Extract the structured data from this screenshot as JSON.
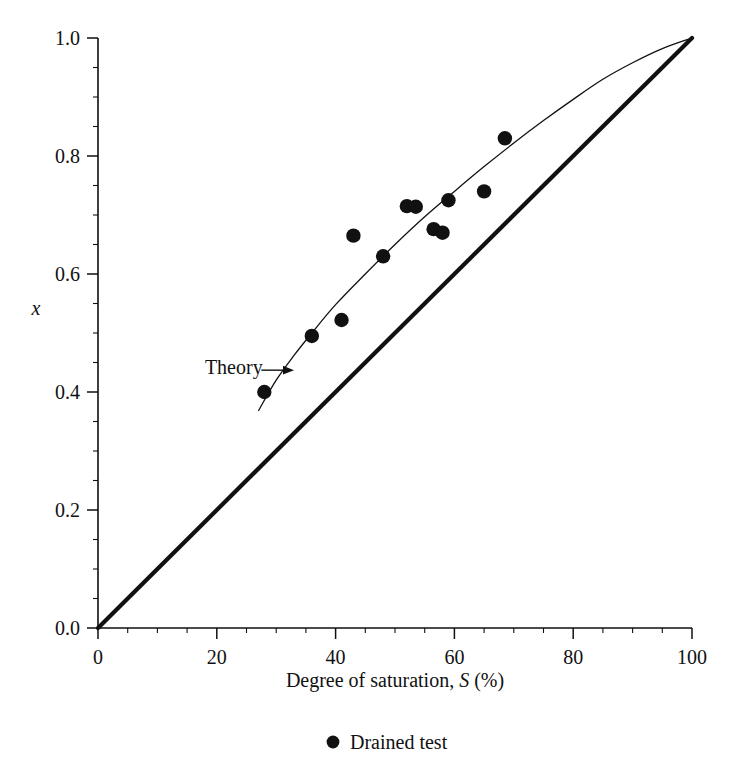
{
  "chart_data": {
    "type": "scatter",
    "title": "",
    "xlabel_text": "Degree of saturation, ",
    "xlabel_symbol": "S",
    "xlabel_units": " (%)",
    "ylabel": "x",
    "xlim": [
      0,
      100
    ],
    "ylim": [
      0.0,
      1.0
    ],
    "grid": false,
    "x_ticks": [
      0,
      20,
      40,
      60,
      80,
      100
    ],
    "x_tick_labels": [
      "0",
      "20",
      "40",
      "60",
      "80",
      "100"
    ],
    "x_minor_step": 5,
    "y_ticks": [
      0.0,
      0.2,
      0.4,
      0.6,
      0.8,
      1.0
    ],
    "y_tick_labels": [
      "0.0",
      "0.2",
      "0.4",
      "0.6",
      "0.8",
      "1.0"
    ],
    "y_minor_step": 0.05,
    "series": [
      {
        "name": "Drained test",
        "type": "scatter",
        "marker": "filled-circle",
        "color": "#111111",
        "points": [
          {
            "x": 28.0,
            "y": 0.4
          },
          {
            "x": 36.0,
            "y": 0.495
          },
          {
            "x": 41.0,
            "y": 0.522
          },
          {
            "x": 43.0,
            "y": 0.665
          },
          {
            "x": 48.0,
            "y": 0.63
          },
          {
            "x": 52.0,
            "y": 0.715
          },
          {
            "x": 53.5,
            "y": 0.714
          },
          {
            "x": 56.5,
            "y": 0.676
          },
          {
            "x": 58.0,
            "y": 0.67
          },
          {
            "x": 59.0,
            "y": 0.725
          },
          {
            "x": 65.0,
            "y": 0.74
          },
          {
            "x": 68.5,
            "y": 0.83
          }
        ]
      },
      {
        "name": "Theory",
        "type": "line",
        "style": "thin",
        "color": "#111111",
        "points": [
          {
            "x": 27.0,
            "y": 0.368
          },
          {
            "x": 30.0,
            "y": 0.42
          },
          {
            "x": 33.0,
            "y": 0.462
          },
          {
            "x": 36.0,
            "y": 0.5
          },
          {
            "x": 40.0,
            "y": 0.548
          },
          {
            "x": 45.0,
            "y": 0.6
          },
          {
            "x": 50.0,
            "y": 0.65
          },
          {
            "x": 55.0,
            "y": 0.697
          },
          {
            "x": 60.0,
            "y": 0.74
          },
          {
            "x": 65.0,
            "y": 0.782
          },
          {
            "x": 70.0,
            "y": 0.822
          },
          {
            "x": 75.0,
            "y": 0.86
          },
          {
            "x": 80.0,
            "y": 0.896
          },
          {
            "x": 85.0,
            "y": 0.93
          },
          {
            "x": 90.0,
            "y": 0.958
          },
          {
            "x": 95.0,
            "y": 0.982
          },
          {
            "x": 100.0,
            "y": 1.0
          }
        ]
      },
      {
        "name": "One-to-one line",
        "type": "line",
        "style": "thick",
        "color": "#111111",
        "points": [
          {
            "x": 0.0,
            "y": 0.0
          },
          {
            "x": 100.0,
            "y": 1.0
          }
        ]
      }
    ],
    "annotations": [
      {
        "name": "theory-annotation",
        "text": "Theory",
        "text_x": 18.0,
        "text_y": 0.442,
        "arrow_from_x": 27.5,
        "arrow_from_y": 0.437,
        "arrow_to_x": 33.0,
        "arrow_to_y": 0.437
      }
    ],
    "legend": {
      "position": "below-axes",
      "entries": [
        {
          "label": "Drained test",
          "marker": "filled-circle",
          "color": "#111111"
        }
      ]
    }
  }
}
